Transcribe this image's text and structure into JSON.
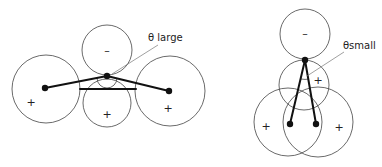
{
  "figures": [
    {
      "id": "left",
      "label": "θ large",
      "circles": [
        {
          "cx": 46,
          "cy": 89,
          "r": 34,
          "sign": "+",
          "sx": 31,
          "sy": 106
        },
        {
          "cx": 107,
          "cy": 50,
          "r": 25,
          "sign": "–",
          "sx": 107,
          "sy": 54
        },
        {
          "cx": 107,
          "cy": 103,
          "r": 24,
          "sign": "+",
          "sx": 107,
          "sy": 118
        },
        {
          "cx": 170,
          "cy": 91,
          "r": 35,
          "sign": "+",
          "sx": 168,
          "sy": 112
        }
      ],
      "nodes": [
        {
          "x": 45,
          "y": 88
        },
        {
          "x": 107,
          "y": 76
        },
        {
          "x": 169,
          "y": 91
        }
      ],
      "bonds": [
        [
          0,
          1
        ],
        [
          1,
          2
        ]
      ],
      "bar": {
        "x1": 80,
        "y1": 89,
        "x2": 136,
        "y2": 89
      },
      "arc": {
        "cx": 107,
        "cy": 76,
        "r": 10
      },
      "leader": {
        "x1": 112,
        "y1": 74,
        "x2": 158,
        "y2": 45
      },
      "label_pos": {
        "x": 148,
        "y": 41
      }
    },
    {
      "id": "right",
      "label": "θsmall",
      "circles": [
        {
          "cx": 305,
          "cy": 34,
          "r": 25,
          "sign": "–",
          "sx": 305,
          "sy": 37
        },
        {
          "cx": 304,
          "cy": 85,
          "r": 25,
          "sign": "+",
          "sx": 318,
          "sy": 84
        },
        {
          "cx": 288,
          "cy": 122,
          "r": 34,
          "sign": "+",
          "sx": 266,
          "sy": 130
        },
        {
          "cx": 318,
          "cy": 122,
          "r": 35,
          "sign": "+",
          "sx": 339,
          "sy": 131
        }
      ],
      "nodes": [
        {
          "x": 305,
          "y": 60
        },
        {
          "x": 290,
          "y": 124
        },
        {
          "x": 316,
          "y": 124
        }
      ],
      "bonds": [
        [
          0,
          1
        ],
        [
          0,
          2
        ]
      ],
      "arc": {
        "cx": 305,
        "cy": 60,
        "r": 20
      },
      "leader": {
        "x1": 307,
        "y1": 76,
        "x2": 344,
        "y2": 52
      },
      "label_pos": {
        "x": 343,
        "y": 49
      }
    }
  ]
}
